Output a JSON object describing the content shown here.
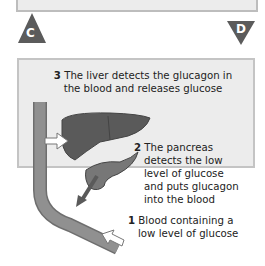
{
  "markers": [
    {
      "label": "C",
      "shape": "triangle-up",
      "color": "#5b5b5b"
    },
    {
      "label": "D",
      "shape": "triangle-down",
      "color": "#5b5b5b"
    }
  ],
  "diagram": {
    "steps": [
      {
        "number": "3",
        "text_line1": "The liver detects the glucagon in",
        "text_line2": "the blood and releases glucose"
      },
      {
        "number": "2",
        "lines": [
          "The pancreas",
          "detects the low",
          "level of glucose",
          "and puts glucagon",
          "into the blood"
        ]
      },
      {
        "number": "1",
        "lines": [
          "Blood containing a",
          "low level of glucose"
        ]
      }
    ],
    "colors": {
      "panel_bg": "#ececec",
      "panel_border": "#c4c4c4",
      "organ": "#5a5a5a",
      "vessel": "#8e8e8e",
      "arrow": "#5a5a5a"
    }
  }
}
